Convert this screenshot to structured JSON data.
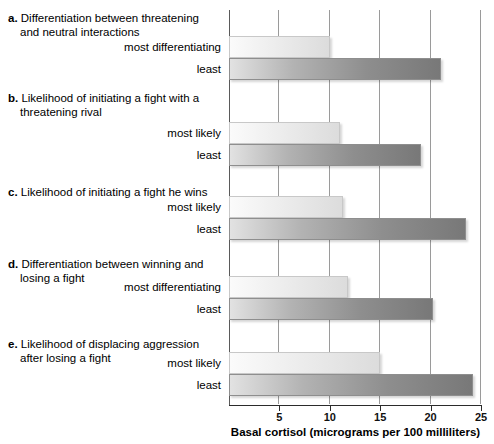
{
  "chart_data": {
    "type": "bar",
    "orientation": "horizontal",
    "title": "",
    "xlabel": "Basal cortisol (micrograms per 100 milliliters)",
    "ylabel": "",
    "xlim": [
      0,
      25
    ],
    "xticks": [
      5,
      10,
      15,
      20,
      25
    ],
    "xtick_labels": [
      "5",
      "10",
      "15",
      "20",
      "25"
    ],
    "grid": "vertical",
    "legend": "none",
    "groups": [
      {
        "letter": "a.",
        "title_line1": "Differentiation between threatening",
        "title_line2": "and neutral interactions",
        "bars": [
          {
            "label": "most differentiating",
            "value": 10,
            "style": "most"
          },
          {
            "label": "least",
            "value": 21,
            "style": "least"
          }
        ]
      },
      {
        "letter": "b.",
        "title_line1": "Likelihood of initiating a fight with a",
        "title_line2": "threatening rival",
        "bars": [
          {
            "label": "most likely",
            "value": 11,
            "style": "most"
          },
          {
            "label": "least",
            "value": 19,
            "style": "least"
          }
        ]
      },
      {
        "letter": "c.",
        "title_line1": "Likelihood of initiating a fight he wins",
        "title_line2": "",
        "bars": [
          {
            "label": "most likely",
            "value": 11.3,
            "style": "most"
          },
          {
            "label": "least",
            "value": 23.5,
            "style": "least"
          }
        ]
      },
      {
        "letter": "d.",
        "title_line1": "Differentiation between winning and",
        "title_line2": "losing a fight",
        "bars": [
          {
            "label": "most differentiating",
            "value": 11.8,
            "style": "most"
          },
          {
            "label": "least",
            "value": 20.2,
            "style": "least"
          }
        ]
      },
      {
        "letter": "e.",
        "title_line1": "Likelihood of displacing aggression",
        "title_line2": "after losing a fight",
        "bars": [
          {
            "label": "most likely",
            "value": 15,
            "style": "most"
          },
          {
            "label": "least",
            "value": 24.2,
            "style": "least"
          }
        ]
      }
    ]
  },
  "colors": {
    "bar_most_start": "#fbfbfb",
    "bar_most_end": "#dcdcdc",
    "bar_least_start": "#e2e2e2",
    "bar_least_end": "#787878",
    "gridline": "#9a9a9a",
    "axis": "#2b2b2b",
    "text": "#000000",
    "background": "#ffffff"
  }
}
